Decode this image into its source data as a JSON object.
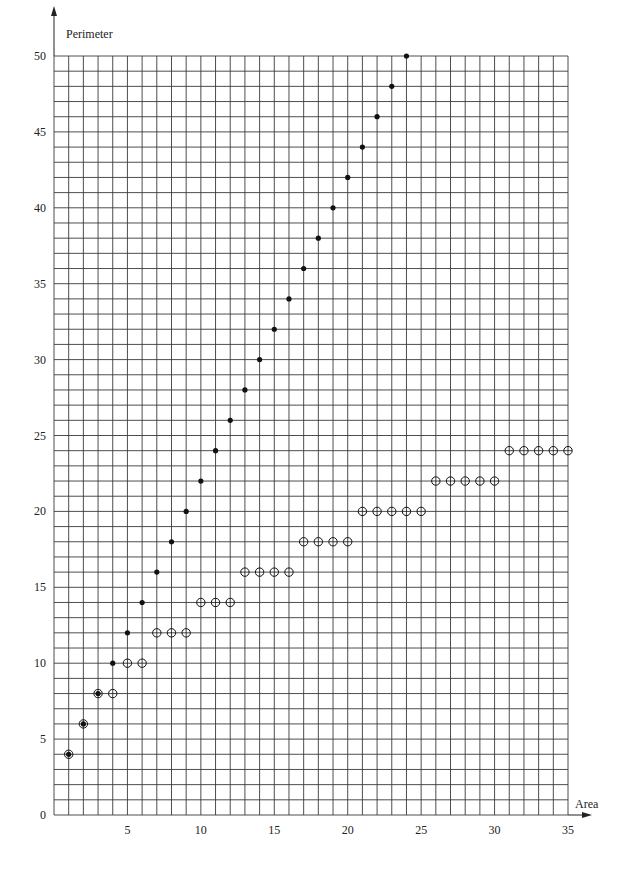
{
  "chart_data": {
    "type": "scatter",
    "title": "",
    "xlabel": "Area",
    "ylabel": "Perimeter",
    "xlim": [
      0,
      35
    ],
    "ylim": [
      0,
      50
    ],
    "grid": true,
    "grid_step": {
      "x": 1,
      "y": 1
    },
    "x_ticks": [
      0,
      5,
      10,
      15,
      20,
      25,
      30,
      35
    ],
    "x_tick_labels": [
      "5",
      "10",
      "15",
      "20",
      "25",
      "30",
      "35"
    ],
    "y_ticks": [
      0,
      5,
      10,
      15,
      20,
      25,
      30,
      35,
      40,
      45,
      50
    ],
    "y_tick_labels": [
      "0",
      "5",
      "10",
      "15",
      "20",
      "25",
      "30",
      "35",
      "40",
      "45",
      "50"
    ],
    "legend": null,
    "series": [
      {
        "name": "Maximum perimeter",
        "marker": "filled-dot",
        "x": [
          1,
          2,
          3,
          4,
          5,
          6,
          7,
          8,
          9,
          10,
          11,
          12,
          13,
          14,
          15,
          16,
          17,
          18,
          19,
          20,
          21,
          22,
          23,
          24
        ],
        "y": [
          4,
          6,
          8,
          10,
          12,
          14,
          16,
          18,
          20,
          22,
          24,
          26,
          28,
          30,
          32,
          34,
          36,
          38,
          40,
          42,
          44,
          46,
          48,
          50
        ]
      },
      {
        "name": "Minimum perimeter",
        "marker": "open-circle",
        "x": [
          1,
          2,
          3,
          4,
          5,
          6,
          7,
          8,
          9,
          10,
          11,
          12,
          13,
          14,
          15,
          16,
          17,
          18,
          19,
          20,
          21,
          22,
          23,
          24,
          25,
          26,
          27,
          28,
          29,
          30,
          31,
          32,
          33,
          34,
          35
        ],
        "y": [
          4,
          6,
          8,
          8,
          10,
          10,
          12,
          12,
          12,
          14,
          14,
          14,
          16,
          16,
          16,
          16,
          18,
          18,
          18,
          18,
          20,
          20,
          20,
          20,
          20,
          22,
          22,
          22,
          22,
          22,
          24,
          24,
          24,
          24,
          24
        ]
      }
    ]
  },
  "colors": {
    "grid": "#3a3a3a",
    "marker": "#111111",
    "background": "#ffffff"
  }
}
